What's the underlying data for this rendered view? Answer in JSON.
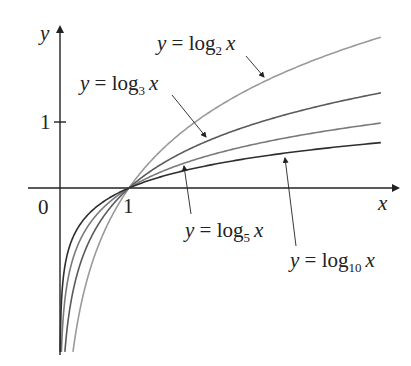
{
  "chart_data": {
    "type": "line",
    "title": "",
    "xlabel": "x",
    "ylabel": "y",
    "origin_label": "0",
    "x_ticks": [
      {
        "value": 1,
        "label": "1"
      }
    ],
    "y_ticks": [
      {
        "value": 1,
        "label": "1"
      }
    ],
    "xlim": [
      0,
      4.65
    ],
    "ylim": [
      -2.41,
      2.4
    ],
    "grid": false,
    "legend": "none (inline arrow labels)",
    "series": [
      {
        "name": "y = log2 x",
        "base": 2,
        "color": "#9a9a9a",
        "label_prefix": "y = log",
        "label_sub": "2",
        "label_suffix": "x"
      },
      {
        "name": "y = log3 x",
        "base": 3,
        "color": "#5a5a5a",
        "label_prefix": "y = log",
        "label_sub": "3",
        "label_suffix": "x"
      },
      {
        "name": "y = log5 x",
        "base": 5,
        "color": "#7a7a7a",
        "label_prefix": "y = log",
        "label_sub": "5",
        "label_suffix": "x"
      },
      {
        "name": "y = log10 x",
        "base": 10,
        "color": "#2e2e2e",
        "label_prefix": "y = log",
        "label_sub": "10",
        "label_suffix": "x"
      }
    ],
    "common_point": {
      "x": 1,
      "y": 0
    }
  }
}
